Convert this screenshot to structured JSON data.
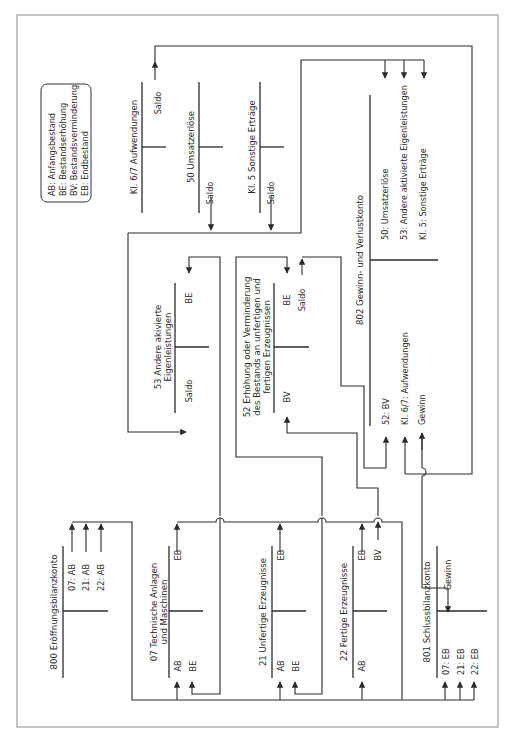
{
  "figure": {
    "orientation": "rotated-90-ccw",
    "line_color": "#2b2b2b",
    "frame_color": "#8a8a8a",
    "background": "#ffffff"
  },
  "legend": {
    "lines": [
      "AB: Anfangsbestand",
      "BE: Bestandserhöhung",
      "BV: Bestandsverminderung",
      "EB: Endbestand"
    ]
  },
  "accounts": {
    "kl67": {
      "title": "Kl. 6/7 Aufwendungen",
      "credit": "Saldo"
    },
    "a50": {
      "title": "50 Umsatzerlöse",
      "debit": "Saldo"
    },
    "kl5": {
      "title": "Kl. 5 Sonstige Erträge",
      "debit": "Saldo"
    },
    "a53": {
      "title_line1": "53 Andere akivierte",
      "title_line2": "Eigenleistungen",
      "debit": "Saldo",
      "credit": "BE"
    },
    "a52": {
      "title_line1": "52 Erhöhung oder Verminderung",
      "title_line2": "des Bestands an unfertigen und",
      "title_line3": "fertigen Erzeugnissen",
      "debit": "BV",
      "credit_1": "BE",
      "credit_2": "Saldo"
    },
    "a802": {
      "title": "802 Gewinn- und Verlustkonto",
      "debit": [
        "52: BV",
        "Kl. 6/7: Aufwendungen",
        "Gewinn"
      ],
      "credit": [
        "50: Umsatzerlöse",
        "53: Andere aktivierte Eigenleistungen",
        "Kl. 5: Sonstige Erträge"
      ]
    },
    "a800": {
      "title": "800 Eröffnungsbilanzkonto",
      "credit": [
        "07: AB",
        "21: AB",
        "22: AB"
      ]
    },
    "a07": {
      "title_line1": "07 Technische Anlagen",
      "title_line2": "und Maschinen",
      "debit": [
        "AB",
        "BE"
      ],
      "credit": "EB"
    },
    "a21": {
      "title": "21 Unfertige Erzeugnisse",
      "debit": [
        "AB",
        "BE"
      ],
      "credit": "EB"
    },
    "a22": {
      "title": "22 Fertige Erzeugnisse",
      "debit": "AB",
      "credit": [
        "EB",
        "BV"
      ]
    },
    "a801": {
      "title": "801 Schlussbilanzkonto",
      "debit": [
        "07: EB",
        "21: EB",
        "22: EB"
      ],
      "credit": "Gewinn"
    }
  }
}
